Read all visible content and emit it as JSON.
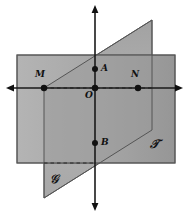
{
  "figure": {
    "type": "geometry-diagram",
    "width": 188,
    "height": 215,
    "background": "#ffffff"
  },
  "colors": {
    "plane_t_fill": "#a8a8a8",
    "plane_t_fill_right": "#9a9a9a",
    "plane_s_fill": "#b0b0b0",
    "plane_s_fill_upper": "#a2a2a2",
    "overlap_fill": "#9c9c9c",
    "stroke": "#4a4a4a",
    "axis": "#1a1a1a",
    "point": "#111111",
    "label": "#111111"
  },
  "planes": [
    {
      "id": "plane-t",
      "label": "𝒯",
      "label_x": 152,
      "label_y": 145,
      "shape": "rectangle",
      "points": [
        [
          17,
          55
        ],
        [
          175,
          55
        ],
        [
          175,
          163
        ],
        [
          17,
          163
        ]
      ]
    },
    {
      "id": "plane-s",
      "label": "𝒢",
      "label_x": 52,
      "label_y": 180,
      "shape": "parallelogram",
      "points": [
        [
          44,
          88
        ],
        [
          152,
          20
        ],
        [
          152,
          130
        ],
        [
          44,
          198
        ]
      ]
    }
  ],
  "axes": [
    {
      "id": "vertical-axis",
      "orientation": "vertical",
      "x1": 95,
      "y1": 8,
      "x2": 95,
      "y2": 208,
      "arrow_start": true,
      "arrow_end": true
    },
    {
      "id": "horizontal-axis",
      "orientation": "horizontal",
      "x1": 10,
      "y1": 88,
      "x2": 180,
      "y2": 88,
      "arrow_start": true,
      "arrow_end": true
    }
  ],
  "hidden_edges": [
    {
      "id": "dashed-m-to-edge",
      "x1": 44,
      "y1": 88,
      "x2": 152,
      "y2": 88
    },
    {
      "id": "dashed-rect-bottom",
      "x1": 44,
      "y1": 163,
      "x2": 95,
      "y2": 163
    }
  ],
  "points": [
    {
      "id": "point-m",
      "label": "M",
      "x": 44,
      "y": 88,
      "label_x": 37,
      "label_y": 74,
      "dot": true
    },
    {
      "id": "point-o",
      "label": "O",
      "x": 95,
      "y": 88,
      "label_x": 86,
      "label_y": 92,
      "dot": true
    },
    {
      "id": "point-n",
      "label": "N",
      "x": 138,
      "y": 88,
      "label_x": 132,
      "label_y": 74,
      "dot": true
    },
    {
      "id": "point-a",
      "label": "A",
      "x": 95,
      "y": 69,
      "label_x": 101,
      "label_y": 64,
      "dot": true
    },
    {
      "id": "point-b",
      "label": "B",
      "x": 95,
      "y": 143,
      "label_x": 101,
      "label_y": 138,
      "dot": true
    }
  ]
}
